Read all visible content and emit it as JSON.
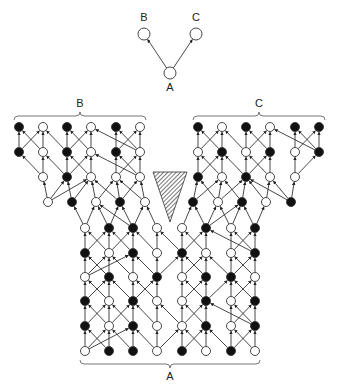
{
  "top_diagram": {
    "nodes": [
      {
        "id": "B",
        "label": "B",
        "x": 144,
        "y": 34,
        "label_y": 21
      },
      {
        "id": "C",
        "label": "C",
        "x": 196,
        "y": 34,
        "label_y": 21
      },
      {
        "id": "A",
        "label": "A",
        "x": 170,
        "y": 73,
        "label_y": 91
      }
    ],
    "edges": [
      [
        "A",
        "B"
      ],
      [
        "A",
        "C"
      ]
    ]
  },
  "network": {
    "brackets": [
      {
        "label": "B",
        "x1": 14,
        "x2": 146,
        "y": 120,
        "label_x": 80,
        "label_y": 107,
        "orient": "up"
      },
      {
        "label": "C",
        "x1": 193,
        "x2": 325,
        "y": 120,
        "label_x": 259,
        "label_y": 107,
        "orient": "up"
      },
      {
        "label": "A",
        "x1": 80,
        "x2": 260,
        "y": 360,
        "label_x": 170,
        "label_y": 380,
        "orient": "down"
      }
    ],
    "legend_shape": {
      "name": "hatched-triangle",
      "points": "153,172 187,172 170,222"
    },
    "node_radius": 4.5,
    "rows": [
      {
        "y": 127,
        "nodes": [
          [
            19,
            1
          ],
          [
            43,
            0
          ],
          [
            67,
            1
          ],
          [
            91,
            0
          ],
          [
            116,
            1
          ],
          [
            140,
            0
          ],
          [
            198,
            1
          ],
          [
            222,
            0
          ],
          [
            246,
            1
          ],
          [
            270,
            0
          ],
          [
            295,
            1
          ],
          [
            319,
            1
          ]
        ]
      },
      {
        "y": 152,
        "nodes": [
          [
            19,
            1
          ],
          [
            43,
            0
          ],
          [
            67,
            1
          ],
          [
            91,
            0
          ],
          [
            116,
            1
          ],
          [
            140,
            0
          ],
          [
            198,
            0
          ],
          [
            222,
            1
          ],
          [
            246,
            0
          ],
          [
            270,
            1
          ],
          [
            295,
            0
          ],
          [
            319,
            1
          ]
        ]
      },
      {
        "y": 177,
        "nodes": [
          [
            43,
            0
          ],
          [
            67,
            1
          ],
          [
            91,
            0
          ],
          [
            116,
            0
          ],
          [
            140,
            0
          ],
          [
            198,
            1
          ],
          [
            222,
            0
          ],
          [
            246,
            1
          ],
          [
            270,
            0
          ],
          [
            295,
            0
          ]
        ]
      },
      {
        "y": 202,
        "nodes": [
          [
            48,
            0
          ],
          [
            72,
            1
          ],
          [
            96,
            0
          ],
          [
            120,
            1
          ],
          [
            145,
            0
          ],
          [
            193,
            1
          ],
          [
            218,
            0
          ],
          [
            242,
            1
          ],
          [
            266,
            0
          ],
          [
            291,
            1
          ]
        ]
      },
      {
        "y": 228,
        "nodes": [
          [
            85,
            0
          ],
          [
            109,
            1
          ],
          [
            133,
            1
          ],
          [
            157,
            0
          ],
          [
            182,
            0
          ],
          [
            206,
            1
          ],
          [
            231,
            0
          ],
          [
            255,
            1
          ]
        ]
      },
      {
        "y": 253,
        "nodes": [
          [
            85,
            1
          ],
          [
            109,
            0
          ],
          [
            133,
            1
          ],
          [
            157,
            0
          ],
          [
            182,
            1
          ],
          [
            206,
            0
          ],
          [
            231,
            0
          ],
          [
            255,
            1
          ]
        ]
      },
      {
        "y": 277,
        "nodes": [
          [
            85,
            0
          ],
          [
            109,
            1
          ],
          [
            133,
            0
          ],
          [
            157,
            1
          ],
          [
            182,
            0
          ],
          [
            206,
            1
          ],
          [
            231,
            1
          ],
          [
            255,
            0
          ]
        ]
      },
      {
        "y": 301,
        "nodes": [
          [
            85,
            1
          ],
          [
            109,
            0
          ],
          [
            133,
            1
          ],
          [
            157,
            0
          ],
          [
            182,
            0
          ],
          [
            206,
            1
          ],
          [
            231,
            0
          ],
          [
            255,
            1
          ]
        ]
      },
      {
        "y": 326,
        "nodes": [
          [
            85,
            1
          ],
          [
            109,
            0
          ],
          [
            133,
            1
          ],
          [
            157,
            0
          ],
          [
            182,
            0
          ],
          [
            206,
            1
          ],
          [
            231,
            0
          ],
          [
            255,
            1
          ]
        ]
      },
      {
        "y": 351,
        "nodes": [
          [
            85,
            0
          ],
          [
            109,
            1
          ],
          [
            133,
            1
          ],
          [
            157,
            0
          ],
          [
            182,
            1
          ],
          [
            206,
            0
          ],
          [
            231,
            1
          ],
          [
            255,
            0
          ]
        ]
      }
    ]
  },
  "colors": {
    "stroke": "#333333",
    "filled": "#111111",
    "open": "#ffffff",
    "hatch": "#555555"
  }
}
